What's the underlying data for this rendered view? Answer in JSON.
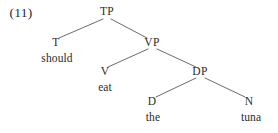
{
  "figure": {
    "example_number": "(11)",
    "type": "syntax-tree",
    "background_color": "#ffffff",
    "text_color": "#2b2b2b",
    "line_color": "#5a5a5a",
    "sentence": "should eat the tuna"
  },
  "nodes": [
    {
      "id": "TP",
      "label": "TP",
      "x": 107,
      "y": 12,
      "kind": "nonterminal"
    },
    {
      "id": "T",
      "label": "T",
      "x": 56,
      "y": 43,
      "kind": "nonterminal"
    },
    {
      "id": "VP",
      "label": "VP",
      "x": 152,
      "y": 43,
      "kind": "nonterminal"
    },
    {
      "id": "V",
      "label": "V",
      "x": 105,
      "y": 72,
      "kind": "nonterminal"
    },
    {
      "id": "DP",
      "label": "DP",
      "x": 200,
      "y": 72,
      "kind": "nonterminal"
    },
    {
      "id": "D",
      "label": "D",
      "x": 152,
      "y": 102,
      "kind": "nonterminal"
    },
    {
      "id": "N",
      "label": "N",
      "x": 249,
      "y": 102,
      "kind": "nonterminal"
    }
  ],
  "terminals": [
    {
      "id": "should",
      "label": "should",
      "x": 57,
      "y": 59,
      "parent": "T"
    },
    {
      "id": "eat",
      "label": "eat",
      "x": 105,
      "y": 88,
      "parent": "V"
    },
    {
      "id": "the",
      "label": "the",
      "x": 153,
      "y": 118,
      "parent": "D"
    },
    {
      "id": "tuna",
      "label": "tuna",
      "x": 251,
      "y": 118,
      "parent": "N"
    }
  ],
  "branches": [
    {
      "id": "TP-T",
      "from": "TP",
      "to": "T",
      "x1": 103,
      "y1": 19,
      "x2": 59,
      "y2": 38
    },
    {
      "id": "TP-VP",
      "from": "TP",
      "to": "VP",
      "x1": 111,
      "y1": 19,
      "x2": 147,
      "y2": 38
    },
    {
      "id": "VP-V",
      "from": "VP",
      "to": "V",
      "x1": 148,
      "y1": 49,
      "x2": 108,
      "y2": 67
    },
    {
      "id": "VP-DP",
      "from": "VP",
      "to": "DP",
      "x1": 157,
      "y1": 49,
      "x2": 196,
      "y2": 67
    },
    {
      "id": "DP-D",
      "from": "DP",
      "to": "D",
      "x1": 196,
      "y1": 78,
      "x2": 156,
      "y2": 97
    },
    {
      "id": "DP-N",
      "from": "DP",
      "to": "N",
      "x1": 205,
      "y1": 78,
      "x2": 245,
      "y2": 97
    }
  ]
}
